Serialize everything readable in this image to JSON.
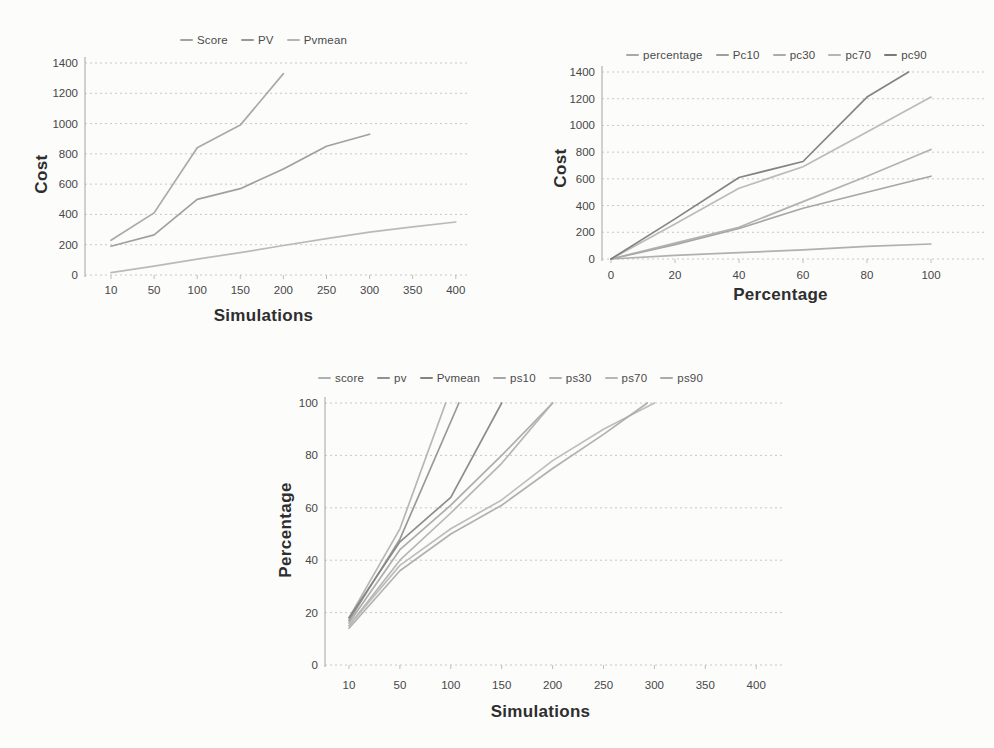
{
  "page": {
    "background": "#fcfcfb",
    "style": "grayscale-photocopy"
  },
  "colors": {
    "gridline": "#c9c9c9",
    "axis": "#b3b3b3",
    "tick_text": "#474747",
    "title_text": "#2e2e2e"
  },
  "chart_data": [
    {
      "type": "line",
      "title": "",
      "xlabel": "Simulations",
      "ylabel": "Cost",
      "grid": "horizontal-dotted",
      "legend_position": "top",
      "x_axis": {
        "type": "category",
        "ticks": [
          10,
          50,
          100,
          150,
          200,
          250,
          300,
          350,
          400
        ]
      },
      "y_axis": {
        "ticks": [
          0,
          200,
          400,
          600,
          800,
          1000,
          1200,
          1400
        ],
        "range": [
          0,
          1400
        ]
      },
      "series": [
        {
          "name": "Score",
          "color": "#a2a2a2",
          "points": [
            [
              10,
              230
            ],
            [
              50,
              410
            ],
            [
              100,
              840
            ],
            [
              150,
              990
            ],
            [
              200,
              1330
            ]
          ]
        },
        {
          "name": "PV",
          "color": "#989898",
          "points": [
            [
              10,
              190
            ],
            [
              50,
              265
            ],
            [
              100,
              500
            ],
            [
              150,
              570
            ],
            [
              200,
              700
            ],
            [
              250,
              850
            ],
            [
              300,
              930
            ]
          ]
        },
        {
          "name": "Pvmean",
          "color": "#b4b4b4",
          "points": [
            [
              10,
              15
            ],
            [
              50,
              58
            ],
            [
              100,
              105
            ],
            [
              150,
              148
            ],
            [
              200,
              195
            ],
            [
              250,
              240
            ],
            [
              300,
              283
            ],
            [
              350,
              318
            ],
            [
              400,
              350
            ]
          ]
        }
      ]
    },
    {
      "type": "line",
      "title": "",
      "xlabel": "Percentage",
      "ylabel": "Cost",
      "grid": "horizontal-dotted",
      "legend_position": "top",
      "x_axis": {
        "type": "linear",
        "ticks": [
          0,
          20,
          40,
          60,
          80,
          100
        ]
      },
      "y_axis": {
        "ticks": [
          0,
          200,
          400,
          600,
          800,
          1000,
          1200,
          1400
        ],
        "range": [
          0,
          1400
        ]
      },
      "series": [
        {
          "name": "percentage",
          "color": "#a9a9a9",
          "points": [
            [
              0,
              0
            ],
            [
              20,
              28
            ],
            [
              40,
              48
            ],
            [
              60,
              68
            ],
            [
              80,
              95
            ],
            [
              100,
              112
            ]
          ]
        },
        {
          "name": "Pc10",
          "color": "#9e9e9e",
          "points": [
            [
              0,
              0
            ],
            [
              20,
              108
            ],
            [
              40,
              228
            ],
            [
              60,
              380
            ],
            [
              80,
              500
            ],
            [
              100,
              620
            ]
          ]
        },
        {
          "name": "pc30",
          "color": "#ababab",
          "points": [
            [
              0,
              0
            ],
            [
              20,
              118
            ],
            [
              40,
              238
            ],
            [
              60,
              430
            ],
            [
              80,
              620
            ],
            [
              100,
              820
            ]
          ]
        },
        {
          "name": "pc70",
          "color": "#b5b5b5",
          "points": [
            [
              0,
              0
            ],
            [
              20,
              262
            ],
            [
              40,
              530
            ],
            [
              60,
              690
            ],
            [
              80,
              950
            ],
            [
              100,
              1212
            ]
          ]
        },
        {
          "name": "pc90",
          "color": "#7a7a7a",
          "points": [
            [
              0,
              0
            ],
            [
              20,
              300
            ],
            [
              40,
              610
            ],
            [
              60,
              730
            ],
            [
              80,
              1212
            ],
            [
              93,
              1400
            ]
          ]
        }
      ]
    },
    {
      "type": "line",
      "title": "",
      "xlabel": "Simulations",
      "ylabel": "Percentage",
      "grid": "horizontal-dotted",
      "legend_position": "top",
      "x_axis": {
        "type": "category",
        "ticks": [
          10,
          50,
          100,
          150,
          200,
          250,
          300,
          350,
          400
        ]
      },
      "y_axis": {
        "ticks": [
          0,
          20,
          40,
          60,
          80,
          100
        ],
        "range": [
          0,
          100
        ]
      },
      "series": [
        {
          "name": "score",
          "color": "#b0b0b0",
          "points": [
            [
              10,
              18
            ],
            [
              50,
              52
            ],
            [
              95,
              100
            ]
          ]
        },
        {
          "name": "pv",
          "color": "#909090",
          "points": [
            [
              10,
              17
            ],
            [
              50,
              48
            ],
            [
              108,
              100
            ]
          ]
        },
        {
          "name": "Pvmean",
          "color": "#838383",
          "points": [
            [
              10,
              18
            ],
            [
              50,
              47
            ],
            [
              100,
              64
            ],
            [
              150,
              100
            ]
          ]
        },
        {
          "name": "ps10",
          "color": "#a6a6a6",
          "points": [
            [
              10,
              16
            ],
            [
              50,
              44
            ],
            [
              100,
              61
            ],
            [
              150,
              80
            ],
            [
              200,
              100
            ]
          ]
        },
        {
          "name": "ps30",
          "color": "#b0b0b0",
          "points": [
            [
              10,
              15
            ],
            [
              50,
              40
            ],
            [
              100,
              58
            ],
            [
              150,
              77
            ],
            [
              200,
              100
            ]
          ]
        },
        {
          "name": "ps70",
          "color": "#b7b7b7",
          "points": [
            [
              10,
              15
            ],
            [
              50,
              38
            ],
            [
              100,
              52
            ],
            [
              150,
              63
            ],
            [
              200,
              78
            ],
            [
              250,
              90
            ],
            [
              300,
              100
            ]
          ]
        },
        {
          "name": "ps90",
          "color": "#aaaaaa",
          "points": [
            [
              10,
              14
            ],
            [
              50,
              36
            ],
            [
              100,
              50
            ],
            [
              150,
              61
            ],
            [
              200,
              75
            ],
            [
              250,
              88
            ],
            [
              293,
              100
            ]
          ]
        }
      ]
    }
  ]
}
